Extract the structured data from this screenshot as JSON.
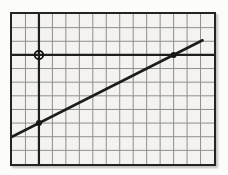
{
  "chart_data": {
    "type": "line",
    "title": "",
    "xlabel": "",
    "ylabel": "",
    "grid": {
      "cols": 15,
      "rows": 11,
      "grid_on": true
    },
    "axes": {
      "origin_col": 2,
      "origin_row": 3,
      "x_range": [
        -2,
        13
      ],
      "y_range": [
        -8,
        3
      ],
      "tick_labels": []
    },
    "line": {
      "equation": "y = 0.5x - 5",
      "slope": 0.5,
      "y_intercept": -5,
      "x_start": -2.45,
      "x_end": 12.15
    },
    "points": [
      {
        "x": 0,
        "y": 0,
        "style": "open",
        "name": "origin-open-point"
      },
      {
        "x": 0,
        "y": -5,
        "style": "filled",
        "name": "y-intercept-point"
      },
      {
        "x": 10,
        "y": 0,
        "style": "filled",
        "name": "x-intercept-point"
      }
    ],
    "colors": {
      "grid": "#8f8f8f",
      "axis": "#1f1f1f",
      "line": "#1c1c1c",
      "point": "#161616",
      "plot_background": "#f4f3f0",
      "page_background": "#fcfcfa",
      "border": "#242424"
    }
  }
}
